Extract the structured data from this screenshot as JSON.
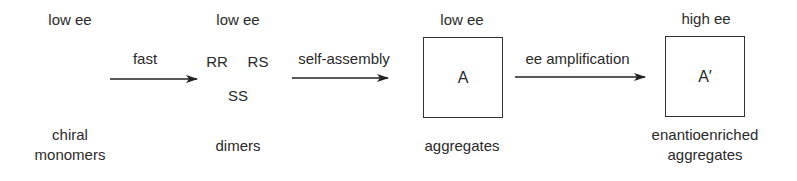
{
  "stages": [
    {
      "ee": "low ee",
      "label_line1": "chiral",
      "label_line2": "monomers"
    },
    {
      "ee": "low ee",
      "species": [
        "RR",
        "RS",
        "SS"
      ],
      "label_line1": "dimers"
    },
    {
      "ee": "low ee",
      "box_label": "A",
      "label_line1": "aggregates"
    },
    {
      "ee": "high ee",
      "box_label": "A′",
      "label_line1": "enantioenriched",
      "label_line2": "aggregates"
    }
  ],
  "arrows": [
    {
      "label": "fast"
    },
    {
      "label": "self-assembly"
    },
    {
      "label": "ee amplification"
    }
  ]
}
